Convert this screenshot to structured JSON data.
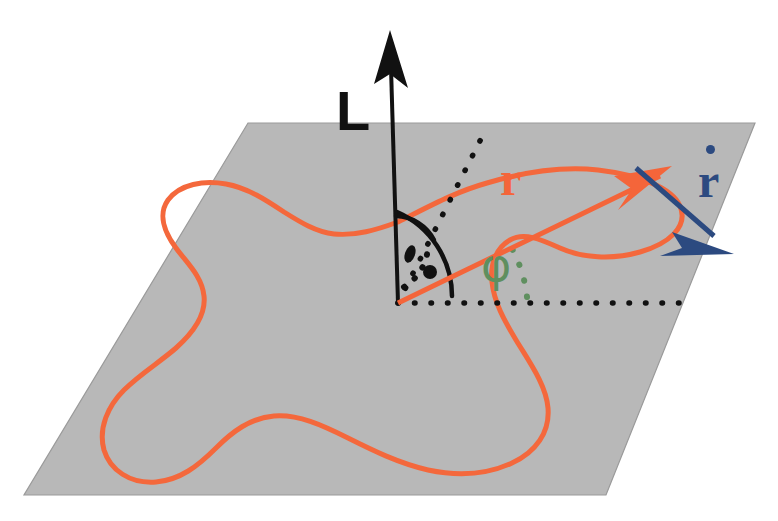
{
  "figure": {
    "background_color": "#ffffff"
  },
  "plane": {
    "name": "reference-plane",
    "fill_color": "#b8b8b8",
    "stroke_color": "#8f8f8f",
    "corners": [
      {
        "x": 248,
        "y": 123
      },
      {
        "x": 755,
        "y": 123
      },
      {
        "x": 606,
        "y": 495
      },
      {
        "x": 24,
        "y": 495
      }
    ]
  },
  "vectors": {
    "L": {
      "label": "L",
      "color": "#111111",
      "from": {
        "x": 398,
        "y": 303
      },
      "to": {
        "x": 390,
        "y": 32
      },
      "label_pos": {
        "x": 336,
        "y": 83
      }
    },
    "r": {
      "label": "r",
      "color": "#f4653a",
      "from": {
        "x": 398,
        "y": 303
      },
      "to": {
        "x": 668,
        "y": 172
      },
      "label_pos": {
        "x": 500,
        "y": 155
      }
    },
    "rdot": {
      "label": "r",
      "accent": "dot",
      "color": "#2c4a80",
      "from": {
        "x": 636,
        "y": 168
      },
      "to": {
        "x": 728,
        "y": 248
      },
      "label_pos": {
        "x": 698,
        "y": 157
      }
    }
  },
  "angles": {
    "theta": {
      "label": "",
      "color": "#111111",
      "description": "angle between L axis and dotted reference line"
    },
    "phi": {
      "label": "φ",
      "color": "#5f8f5f",
      "label_pos": {
        "x": 481,
        "y": 242
      },
      "description": "azimuthal angle from horizontal dotted axis to r"
    }
  },
  "curve": {
    "name": "closed-orbit-curve",
    "color": "#f4683c",
    "stroke_width": 5,
    "closed": true
  },
  "dotted_lines": {
    "horizontal_axis": {
      "color": "#111111",
      "from": {
        "x": 398,
        "y": 303
      },
      "to": {
        "x": 692,
        "y": 303
      }
    },
    "diagonal_reference": {
      "color": "#111111",
      "from": {
        "x": 398,
        "y": 303
      },
      "to": {
        "x": 486,
        "y": 129
      }
    }
  },
  "colors": {
    "plane_gray": "#b8b8b8",
    "curve_orange": "#f4683c",
    "vector_orange": "#f4653a",
    "vector_blue": "#2c4a80",
    "angle_green": "#5f8f5f",
    "black": "#111111"
  }
}
